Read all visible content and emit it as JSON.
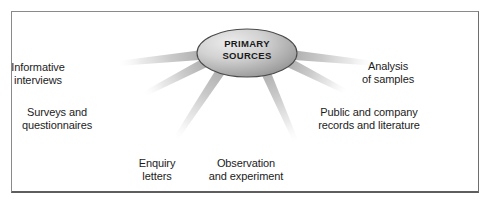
{
  "figure": {
    "type": "radial-diagram",
    "background_color": "#ffffff",
    "frame_color": "#8a8a8a",
    "ray_color": "#c9c9c9",
    "text_color": "#1c1c1c"
  },
  "center": {
    "name": "primary-sources",
    "line1": "PRIMARY",
    "line2": "SOURCES",
    "shape": "ellipse",
    "fill_light": "#e8e8e8",
    "fill_dark": "#9b9b9b",
    "stroke": "#4a4a4a",
    "cx": 247,
    "cy": 53,
    "rx": 50,
    "ry": 24
  },
  "branches": [
    {
      "id": "informative-interviews",
      "line1": "Informative",
      "line2": "interviews",
      "label_x": 38,
      "label_y": 61,
      "ray_end_x": 118,
      "ray_end_y": 66
    },
    {
      "id": "surveys-and-questionnaires",
      "line1": "Surveys and",
      "line2": "questionnaires",
      "label_x": 57,
      "label_y": 106,
      "ray_end_x": 150,
      "ray_end_y": 103
    },
    {
      "id": "enquiry-letters",
      "line1": "Enquiry",
      "line2": "letters",
      "label_x": 157,
      "label_y": 157,
      "ray_end_x": 186,
      "ray_end_y": 145
    },
    {
      "id": "observation-and-experiment",
      "line1": "Observation",
      "line2": "and experiment",
      "label_x": 246,
      "label_y": 157,
      "ray_end_x": 287,
      "ray_end_y": 145
    },
    {
      "id": "public-and-company-records",
      "line1": "Public and company",
      "line2": "records and literature",
      "label_x": 369,
      "label_y": 106,
      "ray_end_x": 341,
      "ray_end_y": 101
    },
    {
      "id": "analysis-of-samples",
      "line1": "Analysis",
      "line2": "of samples",
      "label_x": 388,
      "label_y": 60,
      "ray_end_x": 374,
      "ray_end_y": 66
    }
  ]
}
